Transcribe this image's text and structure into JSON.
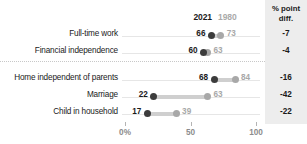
{
  "header": {
    "col_2021": "2021",
    "col_1980": "1980",
    "col_diff_line1": "% point",
    "col_diff_line2": "diff."
  },
  "axis": {
    "ticks": [
      {
        "value": 0,
        "label": "0%"
      },
      {
        "value": 50,
        "label": "50"
      },
      {
        "value": 100,
        "label": "100"
      }
    ]
  },
  "rows": [
    {
      "label": "Full-time work",
      "v2021": "66",
      "v1980": "73",
      "diff": "-7",
      "group": 1
    },
    {
      "label": "Financial independence",
      "v2021": "60",
      "v1980": "63",
      "diff": "-4",
      "group": 1
    },
    {
      "label": "Home independent of parents",
      "v2021": "68",
      "v1980": "84",
      "diff": "-16",
      "group": 2
    },
    {
      "label": "Marriage",
      "v2021": "22",
      "v1980": "63",
      "diff": "-42",
      "group": 2
    },
    {
      "label": "Child in household",
      "v2021": "17",
      "v1980": "39",
      "diff": "-22",
      "group": 2
    }
  ],
  "colors": {
    "dot_2021": "#3c3c3c",
    "dot_1980": "#a8a8a8",
    "connector": "#cfcfcf",
    "diff_band": "#ededed",
    "guide": "#e6e6e6"
  },
  "chart_data": {
    "type": "scatter",
    "subtype": "dumbbell-dot-plot",
    "title": "",
    "xlabel": "",
    "ylabel": "",
    "xlim": [
      0,
      100
    ],
    "grid": false,
    "legend": [
      "2021",
      "1980"
    ],
    "legend_position": "top",
    "categories": [
      "Full-time work",
      "Financial independence",
      "Home independent of parents",
      "Marriage",
      "Child in household"
    ],
    "series": [
      {
        "name": "2021",
        "values": [
          66,
          60,
          68,
          22,
          17
        ]
      },
      {
        "name": "1980",
        "values": [
          73,
          63,
          84,
          63,
          39
        ]
      }
    ],
    "annotations": {
      "column_title": "% point diff.",
      "values": [
        -7,
        -4,
        -16,
        -42,
        -22
      ]
    },
    "tick_labels": [
      "0%",
      "50",
      "100"
    ],
    "group_divider_after_index": 1
  }
}
